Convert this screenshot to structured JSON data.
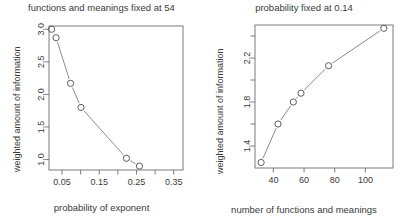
{
  "chart_data": [
    {
      "type": "scatter",
      "panel": "left",
      "title": "functions and meanings fixed at 54",
      "xlabel": "probability of exponent",
      "ylabel": "weighted amount of information",
      "grid": false,
      "legend": "none",
      "marker": "open-circle",
      "line": "solid-connecting",
      "xlim": [
        0.015,
        0.375
      ],
      "ylim": [
        0.84,
        3.05
      ],
      "xticks": [
        0.05,
        0.1,
        0.15,
        0.2,
        0.25,
        0.3,
        0.35
      ],
      "xtick_labels": [
        "0.05",
        "",
        "0.15",
        "",
        "0.25",
        "",
        "0.35"
      ],
      "yticks": [
        1.0,
        1.5,
        2.0,
        2.5,
        3.0
      ],
      "ytick_labels": [
        "1.0",
        "1.5",
        "2.0",
        "2.5",
        "3.0"
      ],
      "x": [
        0.022,
        0.034,
        0.073,
        0.101,
        0.223,
        0.258
      ],
      "y": [
        3.0,
        2.87,
        2.17,
        1.8,
        1.02,
        0.9
      ]
    },
    {
      "type": "scatter",
      "panel": "right",
      "title": "probability fixed at 0.14",
      "xlabel": "number of functions and meanings",
      "ylabel": "weighted amount of information",
      "grid": false,
      "legend": "none",
      "marker": "open-circle",
      "line": "solid-connecting",
      "xlim": [
        28,
        118
      ],
      "ylim": [
        1.2,
        2.5
      ],
      "xticks": [
        40,
        60,
        80,
        100
      ],
      "xtick_labels": [
        "40",
        "60",
        "80",
        "100"
      ],
      "yticks": [
        1.4,
        1.6,
        1.8,
        2.0,
        2.2,
        2.4
      ],
      "ytick_labels": [
        "1.4",
        "",
        "1.8",
        "",
        "2.2",
        ""
      ],
      "x": [
        32,
        43,
        53,
        58,
        76,
        112
      ],
      "y": [
        1.25,
        1.6,
        1.8,
        1.88,
        2.13,
        2.47
      ]
    }
  ],
  "style": {
    "axis_color": "#6e6e6e",
    "marker_color": "#555555",
    "line_color": "#777777",
    "text_color": "#3a3a3a",
    "background": "#ffffff"
  }
}
